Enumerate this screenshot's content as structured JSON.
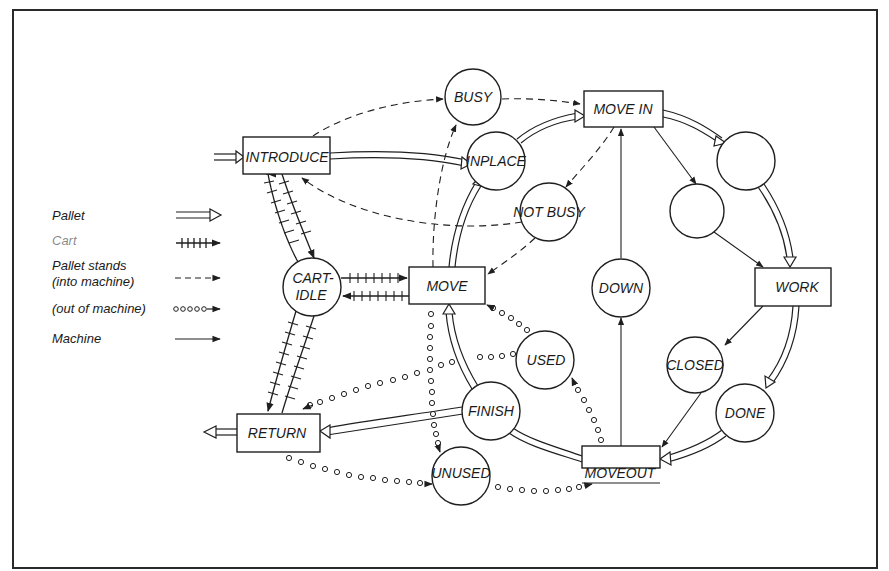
{
  "legend": {
    "items": [
      {
        "label": "Pallet",
        "style": "double-arrow"
      },
      {
        "label": "Cart",
        "style": "hatched-arrow"
      },
      {
        "label": "Pallet stands",
        "label2": "(into machine)",
        "style": "dashed-arrow"
      },
      {
        "label": "(out of machine)",
        "style": "circles-arrow"
      },
      {
        "label": "Machine",
        "style": "solid-arrow"
      }
    ]
  },
  "transitions": {
    "introduce": "INTRODUCE",
    "move_in": "MOVE IN",
    "move": "MOVE",
    "work": "WORK",
    "return": "RETURN",
    "moveout": "MOVEOUT"
  },
  "places": {
    "busy": "BUSY",
    "inplace": "INPLACE",
    "not_busy": "NOT BUSY",
    "cart_idle_1": "CART-",
    "cart_idle_2": "IDLE",
    "down": "DOWN",
    "used": "USED",
    "closed": "CLOSED",
    "finish": "FINISH",
    "done": "DONE",
    "unused": "UNUSED",
    "unlabeled_1": "",
    "unlabeled_2": ""
  },
  "colors": {
    "ink": "#1f1f1f",
    "paper": "#ffffff"
  }
}
